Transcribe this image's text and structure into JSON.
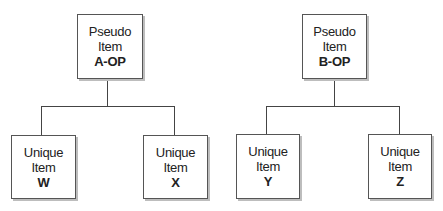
{
  "diagram": {
    "groups": [
      {
        "parent": {
          "line1": "Pseudo",
          "line2": "Item",
          "code": "A-OP"
        },
        "children": [
          {
            "line1": "Unique",
            "line2": "Item",
            "code": "W"
          },
          {
            "line1": "Unique",
            "line2": "Item",
            "code": "X"
          }
        ]
      },
      {
        "parent": {
          "line1": "Pseudo",
          "line2": "Item",
          "code": "B-OP"
        },
        "children": [
          {
            "line1": "Unique",
            "line2": "Item",
            "code": "Y"
          },
          {
            "line1": "Unique",
            "line2": "Item",
            "code": "Z"
          }
        ]
      }
    ],
    "colors": {
      "border": "#555555",
      "line": "#444444",
      "shadow": "#bdbdbd",
      "text": "#222222"
    }
  }
}
